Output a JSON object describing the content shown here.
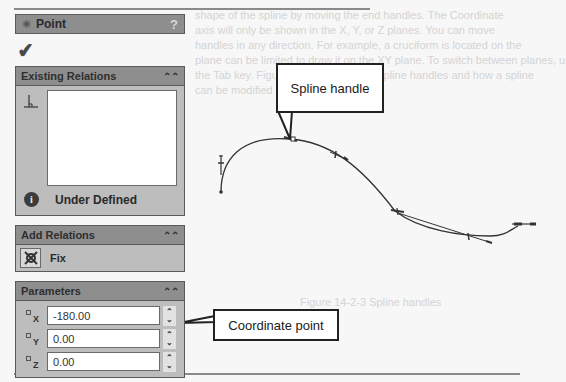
{
  "background": {
    "page_text_lines": [
      "shape of the spline by moving the end handles. The Coordinate ",
      "axis will only be shown in the X, Y, or Z planes. You can move",
      "handles in any direction. For example, a cruciform is located on the",
      "plane can be limited to draw it on the XY plane. To switch between planes, use",
      "the Tab key. Figure 14-2-3 shows the spline handles and how a spline",
      "can be modified using these handles."
    ]
  },
  "property_manager": {
    "title": "Point",
    "title_icon": "point-star-icon",
    "help_label": "?",
    "ok_icon": "checkmark-icon",
    "groups": {
      "existing_relations": {
        "header": "Existing Relations",
        "collapse_icon": "double-chevron-up-icon",
        "list_icon": "perpendicular-relation-icon",
        "items": [],
        "status_icon": "info-icon",
        "status_text": "Under Defined"
      },
      "add_relations": {
        "header": "Add Relations",
        "collapse_icon": "double-chevron-up-icon",
        "items": [
          {
            "label": "Fix",
            "icon": "fix-anchor-icon"
          }
        ]
      },
      "parameters": {
        "header": "Parameters",
        "collapse_icon": "double-chevron-up-icon",
        "fields": [
          {
            "axis": "X",
            "value": "-180.00"
          },
          {
            "axis": "Y",
            "value": "0.00"
          },
          {
            "axis": "Z",
            "value": "0.00"
          }
        ]
      }
    }
  },
  "callouts": {
    "spline_handle": "Spline handle",
    "coordinate_point": "Coordinate point"
  },
  "background_caption": "Figure 14-2-3 Spline handles"
}
